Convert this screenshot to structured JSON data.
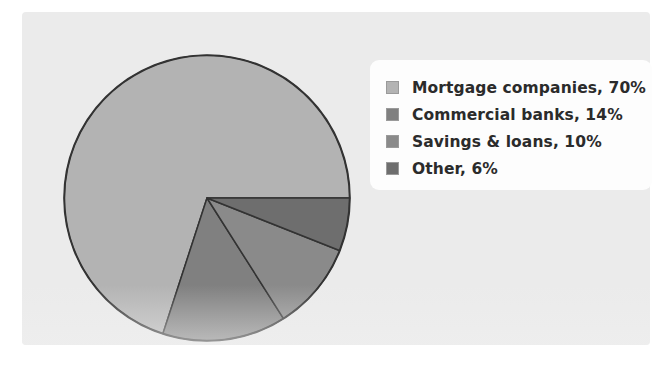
{
  "chart_data": {
    "type": "pie",
    "title": "",
    "subtitle": "",
    "xlabel": "",
    "ylabel": "",
    "legend_position": "right",
    "grid": false,
    "units": "percent",
    "categories": [
      "Mortgage companies",
      "Commercial banks",
      "Savings & loans",
      "Other"
    ],
    "values": [
      70,
      14,
      10,
      6
    ],
    "labels": [
      "Mortgage companies, 70%",
      "Commercial banks, 14%",
      "Savings & loans, 10%",
      "Other, 6%"
    ],
    "colors": [
      "#b3b3b3",
      "#808080",
      "#8a8a8a",
      "#6e6e6e"
    ],
    "slice_outline_color": "#333333",
    "start_angle_deg": 0,
    "direction": "counterclockwise",
    "slices": [
      {
        "name": "Mortgage companies",
        "value": 70,
        "color": "#b3b3b3",
        "label": "Mortgage companies, 70%"
      },
      {
        "name": "Commercial banks",
        "value": 14,
        "color": "#808080",
        "label": "Commercial banks, 14%"
      },
      {
        "name": "Savings & loans",
        "value": 10,
        "color": "#8a8a8a",
        "label": "Savings & loans, 10%"
      },
      {
        "name": "Other",
        "value": 6,
        "color": "#6e6e6e",
        "label": "Other, 6%"
      }
    ]
  },
  "legend": {
    "items": [
      {
        "label": "Mortgage companies, 70%",
        "color": "#b3b3b3"
      },
      {
        "label": "Commercial banks, 14%",
        "color": "#808080"
      },
      {
        "label": "Savings & loans, 10%",
        "color": "#8a8a8a"
      },
      {
        "label": "Other, 6%",
        "color": "#6e6e6e"
      }
    ]
  },
  "palette": {
    "page_background": "#ffffff",
    "panel_background": "#ebebeb",
    "legend_background": "#fdfdfd",
    "text": "#2b2b2b",
    "outline": "#333333"
  }
}
